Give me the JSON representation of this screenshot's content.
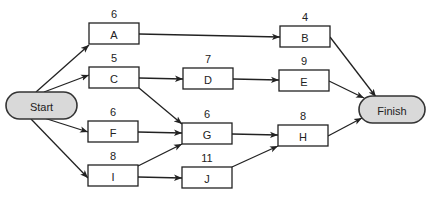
{
  "diagram": {
    "type": "activity-network",
    "start": {
      "id": "start",
      "label": "Start"
    },
    "finish": {
      "id": "finish",
      "label": "Finish"
    },
    "tasks": [
      {
        "id": "A",
        "label": "A",
        "duration": "6"
      },
      {
        "id": "B",
        "label": "B",
        "duration": "4"
      },
      {
        "id": "C",
        "label": "C",
        "duration": "5"
      },
      {
        "id": "D",
        "label": "D",
        "duration": "7"
      },
      {
        "id": "E",
        "label": "E",
        "duration": "9"
      },
      {
        "id": "F",
        "label": "F",
        "duration": "6"
      },
      {
        "id": "G",
        "label": "G",
        "duration": "6"
      },
      {
        "id": "H",
        "label": "H",
        "duration": "8"
      },
      {
        "id": "I",
        "label": "I",
        "duration": "8"
      },
      {
        "id": "J",
        "label": "J",
        "duration": "11"
      }
    ],
    "edges": [
      [
        "start",
        "A"
      ],
      [
        "start",
        "C"
      ],
      [
        "start",
        "F"
      ],
      [
        "start",
        "I"
      ],
      [
        "A",
        "B"
      ],
      [
        "C",
        "D"
      ],
      [
        "C",
        "G"
      ],
      [
        "D",
        "E"
      ],
      [
        "F",
        "G"
      ],
      [
        "I",
        "G"
      ],
      [
        "I",
        "J"
      ],
      [
        "G",
        "H"
      ],
      [
        "J",
        "H"
      ],
      [
        "B",
        "finish"
      ],
      [
        "E",
        "finish"
      ],
      [
        "H",
        "finish"
      ]
    ],
    "colors": {
      "terminal_fill": "#d9d9d9",
      "stroke": "#222222"
    }
  }
}
